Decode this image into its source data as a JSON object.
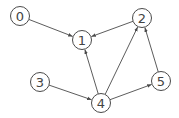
{
  "diagram": {
    "type": "directed-graph",
    "colors": {
      "stroke": "#4a4a4a",
      "text": "#444444",
      "background": "#ffffff"
    },
    "nodes": [
      {
        "id": "0",
        "label": "0",
        "x": 20,
        "y": 16
      },
      {
        "id": "1",
        "label": "1",
        "x": 82,
        "y": 40
      },
      {
        "id": "2",
        "label": "2",
        "x": 142,
        "y": 18
      },
      {
        "id": "3",
        "label": "3",
        "x": 40,
        "y": 82
      },
      {
        "id": "4",
        "label": "4",
        "x": 101,
        "y": 103
      },
      {
        "id": "5",
        "label": "5",
        "x": 161,
        "y": 81
      }
    ],
    "edges": [
      {
        "from": "0",
        "to": "1"
      },
      {
        "from": "2",
        "to": "1"
      },
      {
        "from": "4",
        "to": "1"
      },
      {
        "from": "4",
        "to": "2"
      },
      {
        "from": "5",
        "to": "2"
      },
      {
        "from": "3",
        "to": "4"
      },
      {
        "from": "4",
        "to": "5"
      }
    ]
  }
}
